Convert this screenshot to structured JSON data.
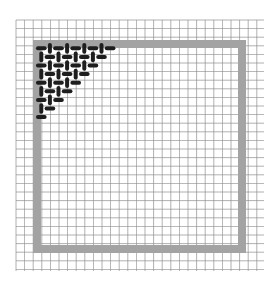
{
  "illustration": {
    "title": "Woven grid corner",
    "background": "#ffffff",
    "grid": {
      "x0": 16,
      "y0": 20,
      "x1": 264,
      "y1": 271,
      "cell": 8.6,
      "color": "#8c8c8c"
    },
    "frame": {
      "x": 33,
      "y": 40,
      "w": 213,
      "h": 213,
      "thickness": 8,
      "color": "#a3a3a3"
    },
    "weave": {
      "color": "#1e1e1e",
      "cell": 8.6,
      "origin_x": 37,
      "origin_y": 44,
      "rows": 9,
      "shape": "triangle-top-left"
    }
  }
}
